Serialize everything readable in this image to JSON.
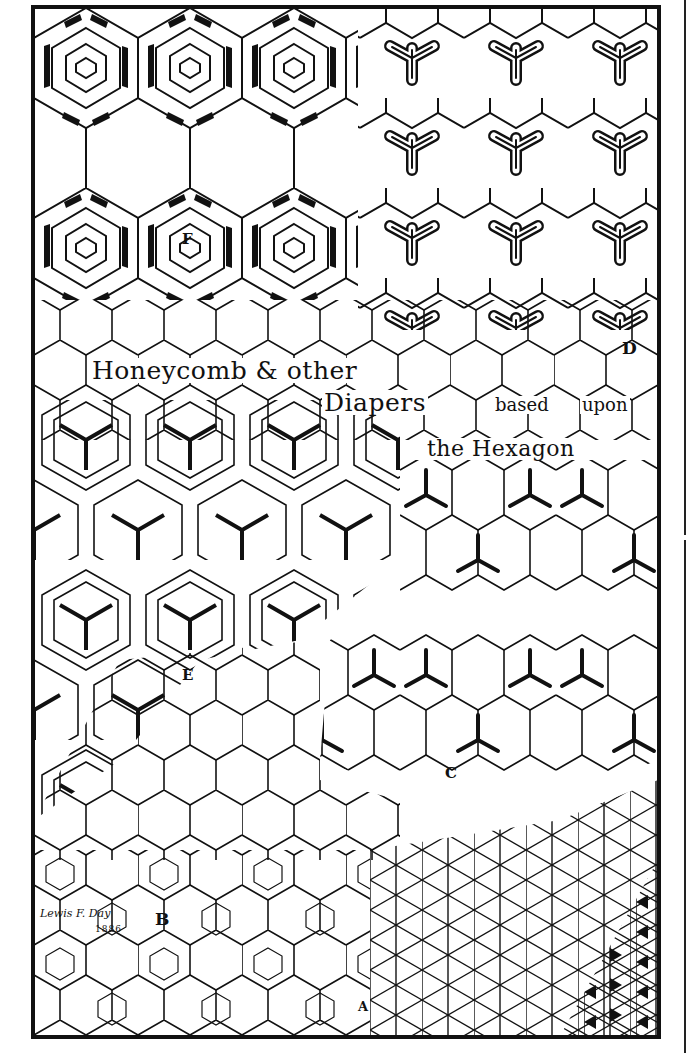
{
  "title": {
    "line1": "Honeycomb & other",
    "line2a": "Diapers",
    "line2b": "based",
    "line2c": "upon",
    "line3": "the Hexagon"
  },
  "sections": {
    "A": "A",
    "B": "B",
    "C": "C",
    "D": "D",
    "E": "E",
    "F": "F"
  },
  "signature": {
    "name": "Lewis F. Day",
    "year": "1886"
  },
  "colors": {
    "ink": "#111111",
    "paper": "#ffffff"
  }
}
